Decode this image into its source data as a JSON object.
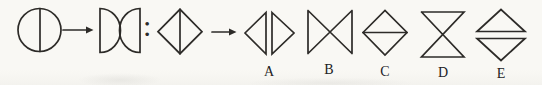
{
  "canvas": {
    "width": 542,
    "height": 85,
    "background": "#f9f8f4",
    "ink": "#2d2b28"
  },
  "puzzle": {
    "premise": {
      "left_shape": "circle-with-vertical-diameter",
      "arrow": "right-arrow",
      "right_shape": "two-semicircles-flat-sides-outward-curves-touching-at-center",
      "separator": ":",
      "question_shape": "diamond-with-vertical-diagonal",
      "result_arrow": "right-arrow"
    },
    "options": [
      {
        "label": "A",
        "shape": "two-triangles-points-outward-flat-vertical-sides-adjacent-with-gap"
      },
      {
        "label": "B",
        "shape": "bowtie-two-triangles-flat-vertical-sides-outward-points-meeting-center"
      },
      {
        "label": "C",
        "shape": "diamond-with-horizontal-diagonal"
      },
      {
        "label": "D",
        "shape": "hourglass-two-triangles-flat-horizontal-sides-outward-points-meeting-center"
      },
      {
        "label": "E",
        "shape": "two-triangles-points-outward-flat-horizontal-sides-adjacent-with-gap"
      }
    ]
  }
}
